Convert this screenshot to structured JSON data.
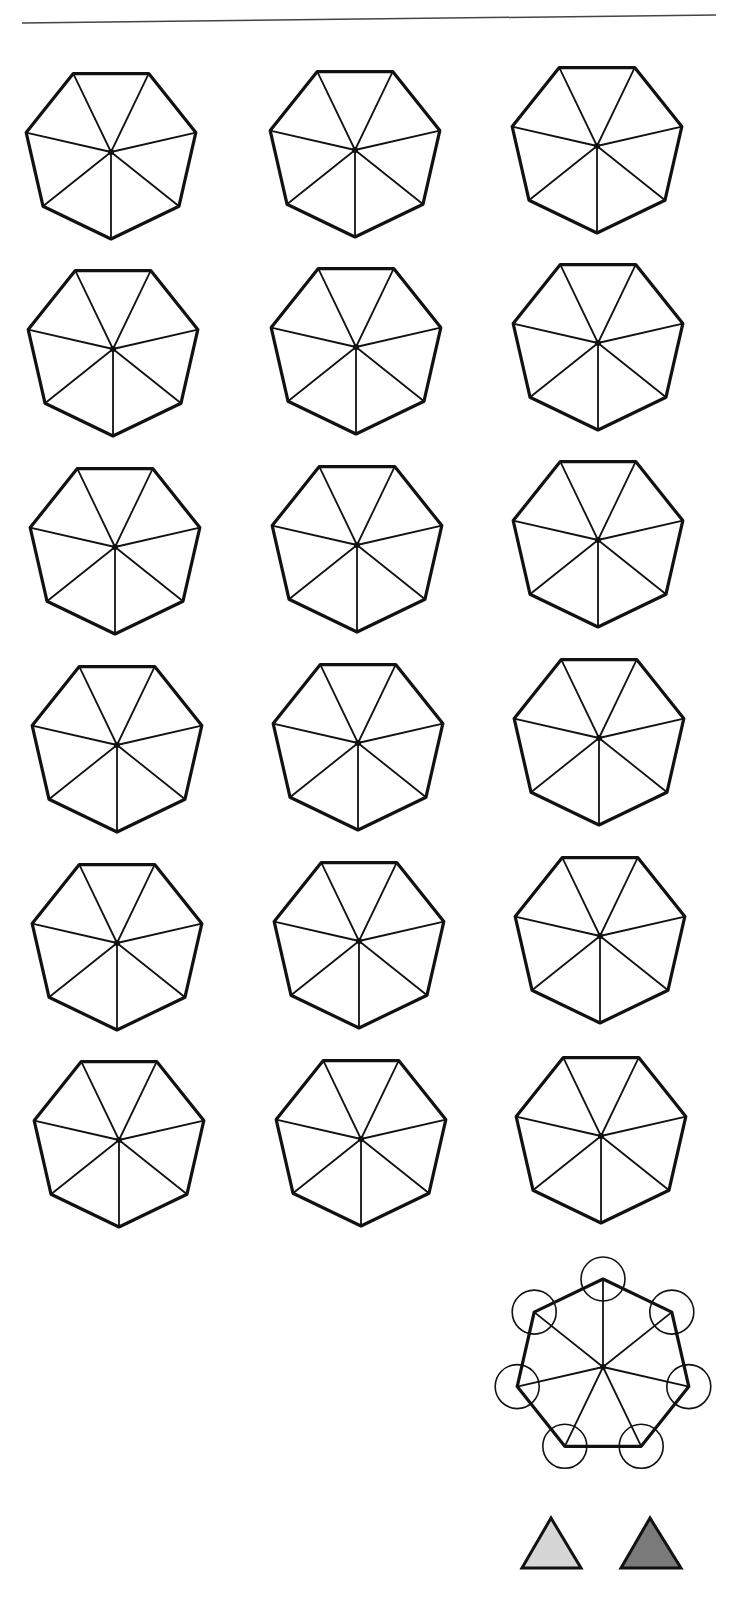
{
  "rule": {
    "x1": 22,
    "y1": 23,
    "x2": 716,
    "y2": 15,
    "color": "#444444"
  },
  "heptagon_style": {
    "stroke": "#111111",
    "radius": 88
  },
  "heptagons": [
    {
      "cx": 111,
      "cy": 152,
      "r": 87,
      "rot": 0
    },
    {
      "cx": 355,
      "cy": 150,
      "r": 87,
      "rot": 0
    },
    {
      "cx": 597,
      "cy": 146,
      "r": 87,
      "rot": 0
    },
    {
      "cx": 113,
      "cy": 349,
      "r": 87,
      "rot": 0
    },
    {
      "cx": 356,
      "cy": 347,
      "r": 87,
      "rot": 0
    },
    {
      "cx": 598,
      "cy": 343,
      "r": 87,
      "rot": 0
    },
    {
      "cx": 115,
      "cy": 547,
      "r": 87,
      "rot": 0
    },
    {
      "cx": 357,
      "cy": 545,
      "r": 87,
      "rot": 0
    },
    {
      "cx": 598,
      "cy": 540,
      "r": 87,
      "rot": 0
    },
    {
      "cx": 117,
      "cy": 745,
      "r": 87,
      "rot": 0
    },
    {
      "cx": 358,
      "cy": 743,
      "r": 87,
      "rot": 0
    },
    {
      "cx": 599,
      "cy": 738,
      "r": 87,
      "rot": 0
    },
    {
      "cx": 117,
      "cy": 943,
      "r": 87,
      "rot": 0
    },
    {
      "cx": 359,
      "cy": 941,
      "r": 87,
      "rot": 0
    },
    {
      "cx": 600,
      "cy": 936,
      "r": 87,
      "rot": 0
    },
    {
      "cx": 119,
      "cy": 1140,
      "r": 87,
      "rot": 0
    },
    {
      "cx": 361,
      "cy": 1139,
      "r": 87,
      "rot": 0
    },
    {
      "cx": 601,
      "cy": 1136,
      "r": 87,
      "rot": 0
    }
  ],
  "highlighted_heptagon": {
    "cx": 603,
    "cy": 1367,
    "r": 88,
    "rot": 180,
    "vertex_circle_radius": 22
  },
  "swatches": [
    {
      "name": "light-triangle",
      "points": "551,1518 522,1568 581,1568",
      "fill": "#d6d6d6"
    },
    {
      "name": "dark-triangle",
      "points": "650,1518 621,1568 681,1568",
      "fill": "#7a7a7a"
    }
  ]
}
